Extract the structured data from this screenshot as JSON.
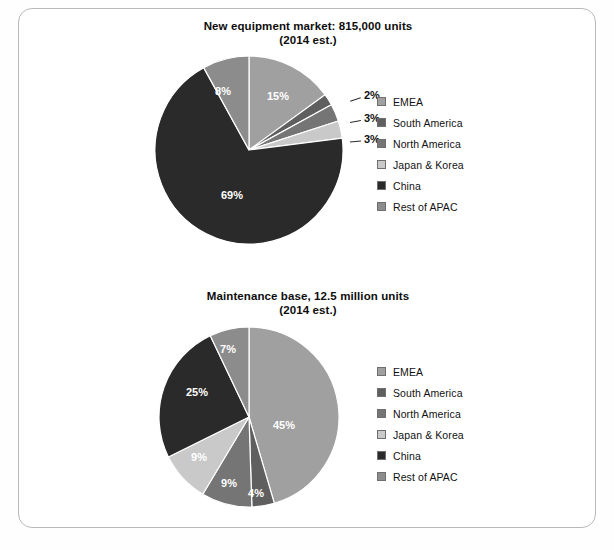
{
  "figure": {
    "background_color": "#ffffff",
    "frame_border_color": "#b9b9b9"
  },
  "palette": {
    "emea": "#a0a0a0",
    "south_america": "#5f5f5f",
    "north_america": "#757575",
    "japan_korea": "#c9c9c9",
    "china": "#2a2a2a",
    "rest_of_apac": "#8c8c8c",
    "label_text": "#ffffff",
    "callout_text": "#111111"
  },
  "legend": {
    "items": [
      {
        "label": "EMEA",
        "color": "#a0a0a0"
      },
      {
        "label": "South America",
        "color": "#5f5f5f"
      },
      {
        "label": "North America",
        "color": "#757575"
      },
      {
        "label": "Japan & Korea",
        "color": "#c9c9c9"
      },
      {
        "label": "China",
        "color": "#2a2a2a"
      },
      {
        "label": "Rest of APAC",
        "color": "#8c8c8c"
      }
    ]
  },
  "chart_data": [
    {
      "type": "pie",
      "id": "new-equipment-market",
      "title": "New equipment market: 815,000 units",
      "subtitle": "(2014 est.)",
      "total_label": "815,000 units",
      "year_note": "2014 est.",
      "categories": [
        "EMEA",
        "South America",
        "North America",
        "Japan & Korea",
        "China",
        "Rest of APAC"
      ],
      "values": [
        15,
        2,
        3,
        3,
        69,
        8
      ],
      "value_labels": [
        "15%",
        "2%",
        "3%",
        "3%",
        "69%",
        "8%"
      ],
      "colors": [
        "#a0a0a0",
        "#5f5f5f",
        "#757575",
        "#c9c9c9",
        "#2a2a2a",
        "#8c8c8c"
      ],
      "label_placement": [
        "inside",
        "callout",
        "callout",
        "callout",
        "inside",
        "inside"
      ],
      "start_angle_deg": 0,
      "legend_position": "right",
      "units": "percent"
    },
    {
      "type": "pie",
      "id": "maintenance-base",
      "title": "Maintenance base, 12.5 million units",
      "subtitle": "(2014 est.)",
      "total_label": "12.5 million units",
      "year_note": "2014 est.",
      "categories": [
        "EMEA",
        "South America",
        "North America",
        "Japan & Korea",
        "China",
        "Rest of APAC"
      ],
      "values": [
        45,
        4,
        9,
        9,
        25,
        7
      ],
      "value_labels": [
        "45%",
        "4%",
        "9%",
        "9%",
        "25%",
        "7%"
      ],
      "colors": [
        "#a0a0a0",
        "#5f5f5f",
        "#757575",
        "#c9c9c9",
        "#2a2a2a",
        "#8c8c8c"
      ],
      "label_placement": [
        "inside",
        "inside",
        "inside",
        "inside",
        "inside",
        "inside"
      ],
      "start_angle_deg": 0,
      "legend_position": "right",
      "units": "percent"
    }
  ]
}
